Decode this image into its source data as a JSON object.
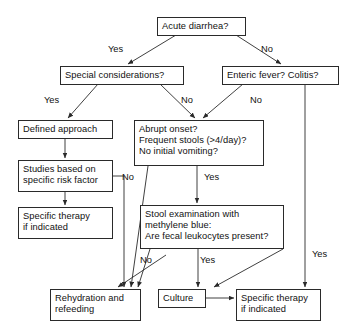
{
  "diagram": {
    "background": "#ffffff",
    "line_color": "#2a2a2a",
    "text_color": "#111111",
    "nodes": [
      {
        "id": "acute_diarrhea",
        "text": "Acute diarrhea?"
      },
      {
        "id": "special",
        "text": "Special considerations?"
      },
      {
        "id": "enteric",
        "text": "Enteric fever? Colitis?"
      },
      {
        "id": "defined_approach",
        "text": "Defined approach"
      },
      {
        "id": "abrupt",
        "text": "Abrupt onset?\nFrequent stools (>4/day)?\nNo initial vomiting?"
      },
      {
        "id": "studies",
        "text": "Studies based on\nspecific risk factor"
      },
      {
        "id": "specific_left",
        "text": "Specific therapy\nif indicated"
      },
      {
        "id": "stool_exam",
        "text": "Stool examination with\nmethylene blue:\nAre fecal leukocytes present?"
      },
      {
        "id": "rehydration",
        "text": "Rehydration and\nrefeeding"
      },
      {
        "id": "culture",
        "text": "Culture"
      },
      {
        "id": "specific_right",
        "text": "Specific therapy\nif indicated"
      }
    ],
    "edge_labels": [
      {
        "id": "yes_acute_special",
        "text": "Yes"
      },
      {
        "id": "no_acute_enteric",
        "text": "No"
      },
      {
        "id": "yes_special_defined",
        "text": "Yes"
      },
      {
        "id": "no_special_abrupt",
        "text": "No"
      },
      {
        "id": "no_enteric_abrupt",
        "text": "No"
      },
      {
        "id": "no_abrupt_rehydr",
        "text": "No"
      },
      {
        "id": "yes_abrupt_stool",
        "text": "Yes"
      },
      {
        "id": "no_stool_rehydr",
        "text": "No"
      },
      {
        "id": "yes_stool_culture",
        "text": "Yes"
      },
      {
        "id": "yes_enteric_specific",
        "text": "Yes"
      }
    ]
  }
}
